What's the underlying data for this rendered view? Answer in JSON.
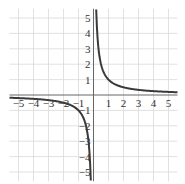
{
  "chart_data": {
    "type": "line",
    "title": "",
    "function": "y = 1/x",
    "xlabel": "",
    "ylabel": "",
    "xlim": [
      -5.6,
      5.6
    ],
    "ylim": [
      -5.6,
      5.6
    ],
    "grid": true,
    "x_tick_labels": [
      "-5",
      "-4",
      "-3",
      "-2",
      "-1",
      "1",
      "2",
      "3",
      "4",
      "5"
    ],
    "y_tick_labels": [
      "5",
      "4",
      "3",
      "2",
      "1",
      "-1",
      "-2",
      "-3",
      "-4",
      "-5"
    ],
    "series": [
      {
        "name": "y = 1/x (x>0)",
        "x": [
          0.18,
          0.2,
          0.25,
          0.33,
          0.5,
          0.75,
          1,
          1.5,
          2,
          3,
          4,
          5,
          5.6
        ],
        "y": [
          5.56,
          5,
          4,
          3.03,
          2,
          1.33,
          1,
          0.67,
          0.5,
          0.33,
          0.25,
          0.2,
          0.18
        ]
      },
      {
        "name": "y = 1/x (x<0)",
        "x": [
          -5.6,
          -5,
          -4,
          -3,
          -2,
          -1.5,
          -1,
          -0.75,
          -0.5,
          -0.33,
          -0.25,
          -0.2,
          -0.18
        ],
        "y": [
          -0.18,
          -0.2,
          -0.25,
          -0.33,
          -0.5,
          -0.67,
          -1,
          -1.33,
          -2,
          -3.03,
          -4,
          -5,
          -5.56
        ]
      }
    ],
    "colors": {
      "curve": "#3a3a3a",
      "axis": "#666666",
      "grid": "#d9d9d9"
    }
  }
}
